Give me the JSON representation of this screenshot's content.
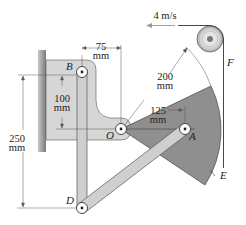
{
  "figure": {
    "velocity_label": "4 m/s",
    "force_label": "F",
    "points": {
      "B": "B",
      "O": "O",
      "A": "A",
      "D": "D",
      "E": "E"
    },
    "dimensions": {
      "horizontal_75": {
        "value": "75",
        "unit": "mm"
      },
      "vertical_100": {
        "value": "100",
        "unit": "mm"
      },
      "vertical_250": {
        "value": "250",
        "unit": "mm"
      },
      "radius_200": {
        "value": "200",
        "unit": "mm"
      },
      "radius_125": {
        "value": "125",
        "unit": "mm"
      }
    },
    "colors": {
      "sector": "#8f8f8f",
      "bracket": "#d4d4d4",
      "links": "#cfcfcf",
      "wall": "#9a9a9a",
      "lines": "#333333"
    }
  }
}
